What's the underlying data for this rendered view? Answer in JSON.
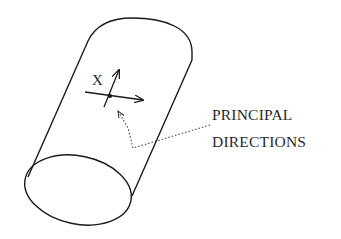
{
  "figure": {
    "type": "diagram",
    "point_label": "X",
    "annotation": {
      "line1": "PRINCIPAL",
      "line2": "DIRECTIONS"
    },
    "colors": {
      "stroke": "#1a1a1a",
      "text": "#2a2a2a",
      "background": "#ffffff"
    }
  }
}
